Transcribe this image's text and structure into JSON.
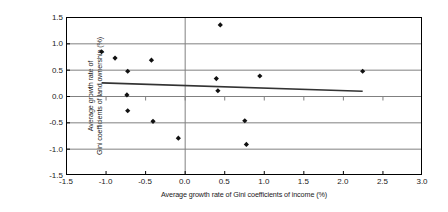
{
  "chart_data": {
    "type": "scatter",
    "title": "",
    "xlabel": "Average growth rate of Gini coefficients of income (%)",
    "ylabel": "Average growth rate of Gini coefficients of land ownership (%)",
    "ylabel_lines": [
      "Average growth rate of",
      "Gini coefficients of land ownership (%)"
    ],
    "xlim": [
      -1.5,
      3.0
    ],
    "ylim": [
      -1.5,
      1.5
    ],
    "xticks": [
      -1.5,
      -1.0,
      -0.5,
      0.0,
      0.5,
      1.0,
      1.5,
      2.0,
      2.5,
      3.0
    ],
    "xtick_labels": [
      "-1.5",
      "-1.0",
      "-0.5",
      "0.0",
      "0.5",
      "1.0",
      "1.5",
      "2.0",
      "2.5",
      "3.0"
    ],
    "yticks": [
      -1.5,
      -1.0,
      -0.5,
      0.0,
      0.5,
      1.0,
      1.5
    ],
    "ytick_labels": [
      "-1.5",
      "-1.0",
      "-0.5",
      "0.0",
      "0.5",
      "1.0",
      "1.5"
    ],
    "grid": "horizontal",
    "legend": "none",
    "marker": "diamond",
    "marker_color": "#111111",
    "axis_color": "#000000",
    "grid_color": "#808080",
    "trend_color": "#333333",
    "points": [
      {
        "x": -1.05,
        "y": 0.84
      },
      {
        "x": -0.88,
        "y": 0.72
      },
      {
        "x": -0.72,
        "y": 0.47
      },
      {
        "x": -0.73,
        "y": 0.02
      },
      {
        "x": -0.72,
        "y": -0.28
      },
      {
        "x": -0.42,
        "y": 0.68
      },
      {
        "x": -0.4,
        "y": -0.48
      },
      {
        "x": -0.08,
        "y": -0.8
      },
      {
        "x": 0.45,
        "y": 1.35
      },
      {
        "x": 0.4,
        "y": 0.33
      },
      {
        "x": 0.42,
        "y": 0.1
      },
      {
        "x": 0.76,
        "y": -0.47
      },
      {
        "x": 0.78,
        "y": -0.92
      },
      {
        "x": 0.95,
        "y": 0.38
      },
      {
        "x": 2.25,
        "y": 0.47
      }
    ],
    "trendline": {
      "type": "linear",
      "x_start": -1.05,
      "y_start": 0.25,
      "x_end": 2.25,
      "y_end": 0.09
    }
  }
}
